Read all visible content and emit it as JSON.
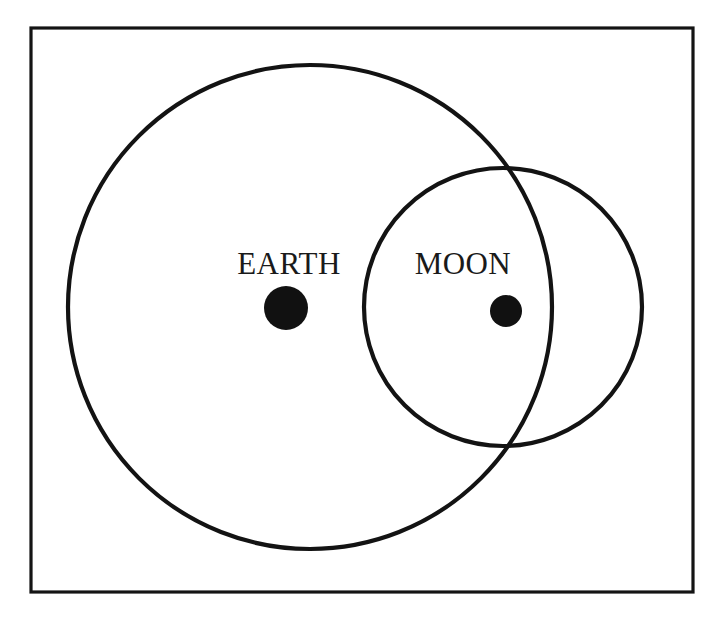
{
  "figure": {
    "background_color": "#ffffff",
    "line_color": "#131313",
    "frame": {
      "name": "border-frame",
      "x": 31,
      "y": 28,
      "width": 662,
      "height": 564,
      "stroke_width": 3.2
    }
  },
  "bodies": [
    {
      "id": "earth",
      "label": "EARTH",
      "label_x": 289,
      "label_y": 263,
      "dot": {
        "cx": 286,
        "cy": 308,
        "r": 22
      },
      "circle": {
        "cx": 310,
        "cy": 307,
        "r": 242,
        "stroke_width": 4.2
      }
    },
    {
      "id": "moon",
      "label": "MOON",
      "label_x": 463,
      "label_y": 263,
      "dot": {
        "cx": 506,
        "cy": 311,
        "r": 16
      },
      "circle": {
        "cx": 503,
        "cy": 307,
        "r": 139,
        "stroke_width": 4.2
      }
    }
  ],
  "chart_data": {
    "type": "diagram",
    "elements": [
      {
        "kind": "rectangle",
        "name": "outer-frame",
        "x": 31,
        "y": 28,
        "width": 662,
        "height": 564
      },
      {
        "kind": "circle",
        "name": "earth-circle",
        "cx": 310,
        "cy": 307,
        "r": 242
      },
      {
        "kind": "circle",
        "name": "moon-circle",
        "cx": 503,
        "cy": 307,
        "r": 139
      },
      {
        "kind": "filled-dot",
        "name": "earth-center-dot",
        "cx": 286,
        "cy": 308,
        "r": 22
      },
      {
        "kind": "filled-dot",
        "name": "moon-center-dot",
        "cx": 506,
        "cy": 311,
        "r": 16
      },
      {
        "kind": "text",
        "name": "earth-label",
        "text": "EARTH",
        "x": 289,
        "y": 263
      },
      {
        "kind": "text",
        "name": "moon-label",
        "text": "MOON",
        "x": 463,
        "y": 263
      }
    ],
    "labels": [
      "EARTH",
      "MOON"
    ]
  }
}
